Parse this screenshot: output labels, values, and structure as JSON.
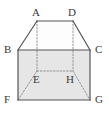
{
  "figure": {
    "kind": "geometry-solid-diagram",
    "canvas": {
      "width": 109,
      "height": 117
    },
    "colors": {
      "background": "#ffffff",
      "face_fill": "#e6e6e6",
      "top_face_fill": "#fdfdfd",
      "solid_edge": "#555555",
      "hidden_edge": "#8a8a8a",
      "label_text": "#3a3a3a"
    },
    "vertices": [
      {
        "id": "A",
        "label": "A",
        "x": 37,
        "y": 21,
        "label_x": 32,
        "label_y": 7
      },
      {
        "id": "D",
        "label": "D",
        "x": 73,
        "y": 21,
        "label_x": 68,
        "label_y": 7
      },
      {
        "id": "B",
        "label": "B",
        "x": 18,
        "y": 50,
        "label_x": 4,
        "label_y": 44
      },
      {
        "id": "C",
        "label": "C",
        "x": 90,
        "y": 50,
        "label_x": 95,
        "label_y": 44
      },
      {
        "id": "E",
        "label": "E",
        "x": 37,
        "y": 71,
        "label_x": 33,
        "label_y": 74
      },
      {
        "id": "H",
        "label": "H",
        "x": 73,
        "y": 71,
        "label_x": 66,
        "label_y": 74
      },
      {
        "id": "F",
        "label": "F",
        "x": 18,
        "y": 100,
        "label_x": 4,
        "label_y": 94
      },
      {
        "id": "G",
        "label": "G",
        "x": 90,
        "y": 100,
        "label_x": 95,
        "label_y": 94
      }
    ],
    "faces": [
      {
        "id": "front-face",
        "name": "front-rectangle-BCGF",
        "points": "18,50 90,50 90,100 18,100",
        "fill": "#e6e6e6"
      },
      {
        "id": "top-face",
        "name": "top-trapezoid-ABCD",
        "points": "37,21 73,21 90,50 18,50",
        "fill": "#fdfdfd"
      }
    ],
    "solid_edges": [
      {
        "id": "AD",
        "name": "edge-A-D",
        "x1": 37,
        "y1": 21,
        "x2": 73,
        "y2": 21
      },
      {
        "id": "AB",
        "name": "edge-A-B",
        "x1": 37,
        "y1": 21,
        "x2": 18,
        "y2": 50
      },
      {
        "id": "DC",
        "name": "edge-D-C",
        "x1": 73,
        "y1": 21,
        "x2": 90,
        "y2": 50
      },
      {
        "id": "BC",
        "name": "edge-B-C",
        "x1": 18,
        "y1": 50,
        "x2": 90,
        "y2": 50
      },
      {
        "id": "BF",
        "name": "edge-B-F",
        "x1": 18,
        "y1": 50,
        "x2": 18,
        "y2": 100
      },
      {
        "id": "CG",
        "name": "edge-C-G",
        "x1": 90,
        "y1": 50,
        "x2": 90,
        "y2": 100
      },
      {
        "id": "FG",
        "name": "edge-F-G",
        "x1": 18,
        "y1": 100,
        "x2": 90,
        "y2": 100
      }
    ],
    "hidden_edges": [
      {
        "id": "AE",
        "name": "hidden-edge-A-E",
        "x1": 37,
        "y1": 21,
        "x2": 37,
        "y2": 71
      },
      {
        "id": "DH",
        "name": "hidden-edge-D-H",
        "x1": 73,
        "y1": 21,
        "x2": 73,
        "y2": 71
      },
      {
        "id": "EH",
        "name": "hidden-edge-E-H",
        "x1": 37,
        "y1": 71,
        "x2": 73,
        "y2": 71
      },
      {
        "id": "EF",
        "name": "hidden-edge-E-F",
        "x1": 37,
        "y1": 71,
        "x2": 18,
        "y2": 100
      },
      {
        "id": "HG",
        "name": "hidden-edge-H-G",
        "x1": 73,
        "y1": 71,
        "x2": 90,
        "y2": 100
      }
    ]
  }
}
